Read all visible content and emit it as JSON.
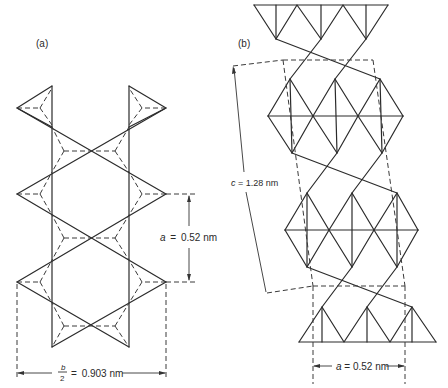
{
  "figure": {
    "panels": [
      {
        "id": "a",
        "label": "(a)",
        "view": "projection along c-axis of paired tetrahedral chains",
        "dimensions": [
          {
            "symbol": "a",
            "equals": "=",
            "value": "0.52 nm"
          },
          {
            "symbol_num": "b",
            "symbol_den": "2",
            "equals": "=",
            "value": "0.903 nm"
          }
        ]
      },
      {
        "id": "b",
        "label": "(b)",
        "view": "layered tetrahedral-octahedral-tetrahedral sheets with unit cell outline",
        "dimensions": [
          {
            "symbol": "c",
            "equals": "=",
            "value": "1.28 nm"
          },
          {
            "symbol": "a",
            "equals": "=",
            "value": "0.52 nm"
          }
        ]
      }
    ],
    "colors": {
      "line": "#2b2b2b",
      "background": "#ffffff"
    }
  }
}
